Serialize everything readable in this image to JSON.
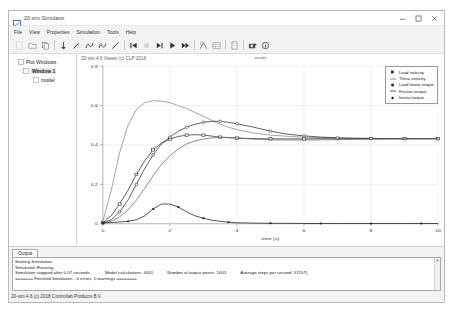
{
  "window": {
    "title": "20-sim Simulator",
    "app_icon": "chart-icon",
    "minimize_label": "—",
    "maximize_label": "☐",
    "close_label": "✕"
  },
  "menu": {
    "items": [
      {
        "label": "File",
        "name": "menu-file"
      },
      {
        "label": "View",
        "name": "menu-view"
      },
      {
        "label": "Properties",
        "name": "menu-properties"
      },
      {
        "label": "Simulation",
        "name": "menu-simulation"
      },
      {
        "label": "Tools",
        "name": "menu-tools"
      },
      {
        "label": "Help",
        "name": "menu-help"
      }
    ]
  },
  "toolbar": {
    "buttons": [
      {
        "name": "new-icon",
        "glyph": "new"
      },
      {
        "name": "open-icon",
        "glyph": "open"
      },
      {
        "name": "copy-icon",
        "glyph": "copy"
      },
      {
        "name": "marker-icon",
        "glyph": "pin"
      },
      {
        "name": "pencil-icon",
        "glyph": "pencil"
      },
      {
        "name": "curve-icon",
        "glyph": "curve"
      },
      {
        "name": "curves-icon",
        "glyph": "curves"
      },
      {
        "name": "line-icon",
        "glyph": "line"
      },
      {
        "name": "skip-start-icon",
        "glyph": "skipstart"
      },
      {
        "name": "stop-icon",
        "glyph": "stop"
      },
      {
        "name": "step-icon",
        "glyph": "step"
      },
      {
        "name": "run-icon",
        "glyph": "run"
      },
      {
        "name": "fast-forward-icon",
        "glyph": "ff"
      },
      {
        "name": "zoom-region-icon",
        "glyph": "zoomregion"
      },
      {
        "name": "table-icon",
        "glyph": "table"
      },
      {
        "name": "doc-icon",
        "glyph": "doc"
      },
      {
        "name": "camera-icon",
        "glyph": "camera"
      },
      {
        "name": "info-icon",
        "glyph": "info"
      }
    ]
  },
  "sidebar": {
    "items": [
      {
        "label": "Plot Windows",
        "level": 1,
        "twisty": "",
        "selected": false,
        "name": "tree-plot-windows"
      },
      {
        "label": "Window 1",
        "level": 2,
        "twisty": "−",
        "selected": true,
        "name": "tree-window-1"
      },
      {
        "label": "model",
        "level": 3,
        "twisty": "",
        "selected": false,
        "name": "tree-model"
      }
    ]
  },
  "plot": {
    "version_text": "20-sim 4.6 Viewer (c) CLP 2018",
    "title": "model"
  },
  "legend": {
    "position": "top-right",
    "entries": [
      {
        "label": "Load velocity",
        "marker": "square",
        "color": "#303030",
        "name": "legend-load-velocity"
      },
      {
        "label": "Theta velocity",
        "marker": "dash",
        "color": "#707070",
        "name": "legend-theta-velocity"
      },
      {
        "label": "Load motor torque",
        "marker": "circle",
        "color": "#303030",
        "name": "legend-load-motor-torque"
      },
      {
        "label": "Friction torque",
        "marker": "dash",
        "color": "#606060",
        "name": "legend-friction-torque"
      },
      {
        "label": "Inertia torque",
        "marker": "dot",
        "color": "#202020",
        "name": "legend-inertia-torque"
      }
    ]
  },
  "chart_data": {
    "type": "line",
    "title": "model",
    "xlabel": "time {s}",
    "ylabel": "",
    "xlim": [
      0,
      10
    ],
    "ylim": [
      0,
      0.8
    ],
    "xticks": [
      "0",
      "2",
      "4",
      "6",
      "8",
      "10"
    ],
    "yticks": [
      "0.8",
      "0.6",
      "0.4",
      "0.2",
      "0"
    ],
    "grid": true,
    "x": [
      0,
      0.25,
      0.5,
      0.75,
      1,
      1.25,
      1.5,
      1.75,
      2,
      2.25,
      2.5,
      2.75,
      3,
      3.25,
      3.5,
      3.75,
      4,
      4.5,
      5,
      5.5,
      6,
      6.5,
      7,
      7.5,
      8,
      8.5,
      9,
      9.5,
      10
    ],
    "series": [
      {
        "name": "Load velocity",
        "color": "#303030",
        "marker": "square",
        "values": [
          0.005,
          0.04,
          0.1,
          0.17,
          0.25,
          0.32,
          0.375,
          0.41,
          0.43,
          0.443,
          0.45,
          0.452,
          0.45,
          0.445,
          0.44,
          0.437,
          0.435,
          0.432,
          0.431,
          0.431,
          0.431,
          0.432,
          0.432,
          0.432,
          0.432,
          0.432,
          0.432,
          0.432,
          0.432
        ]
      },
      {
        "name": "Theta velocity",
        "color": "#8a8a8a",
        "marker": "none",
        "values": [
          0.01,
          0.17,
          0.36,
          0.5,
          0.58,
          0.615,
          0.625,
          0.622,
          0.615,
          0.6,
          0.585,
          0.565,
          0.545,
          0.525,
          0.505,
          0.49,
          0.478,
          0.46,
          0.45,
          0.444,
          0.44,
          0.437,
          0.435,
          0.434,
          0.433,
          0.433,
          0.432,
          0.432,
          0.432
        ]
      },
      {
        "name": "Load motor torque",
        "color": "#303030",
        "marker": "circle",
        "values": [
          0.003,
          0.02,
          0.06,
          0.12,
          0.2,
          0.28,
          0.35,
          0.405,
          0.44,
          0.47,
          0.49,
          0.505,
          0.515,
          0.52,
          0.52,
          0.515,
          0.508,
          0.49,
          0.47,
          0.455,
          0.446,
          0.44,
          0.436,
          0.434,
          0.433,
          0.432,
          0.432,
          0.432,
          0.432
        ]
      },
      {
        "name": "Friction torque",
        "color": "#6a6a6a",
        "marker": "none",
        "values": [
          0.002,
          0.012,
          0.035,
          0.07,
          0.12,
          0.18,
          0.245,
          0.3,
          0.345,
          0.38,
          0.405,
          0.42,
          0.43,
          0.436,
          0.438,
          0.437,
          0.435,
          0.43,
          0.426,
          0.425,
          0.425,
          0.426,
          0.427,
          0.428,
          0.429,
          0.43,
          0.43,
          0.431,
          0.431
        ]
      },
      {
        "name": "Inertia torque",
        "color": "#202020",
        "marker": "dot",
        "values": [
          0.004,
          0.006,
          0.009,
          0.012,
          0.02,
          0.04,
          0.075,
          0.1,
          0.1,
          0.085,
          0.06,
          0.04,
          0.028,
          0.018,
          0.012,
          0.008,
          0.005,
          0.003,
          0.002,
          0.002,
          0.001,
          0.001,
          0.001,
          0.001,
          0.001,
          0.001,
          0.001,
          0.001,
          0.001
        ]
      }
    ]
  },
  "output": {
    "tab_label": "Output",
    "lines": [
      "Starting Simulation.",
      "Simulation Running..."
    ],
    "stats_row": [
      "Simulation stopped after 0.07 seconds.",
      "Model calculations: 4001",
      "Number of output points: 1001",
      "Average steps per second: 57157)"
    ],
    "final_line": "======= Finished Simulation - 0 errors, 0 warnings ========",
    "scroll_up": "▲",
    "scroll_down": "▼"
  },
  "statusbar": {
    "text": "20-sim 4.6 (c) 2018 Controllab Products B.V."
  }
}
